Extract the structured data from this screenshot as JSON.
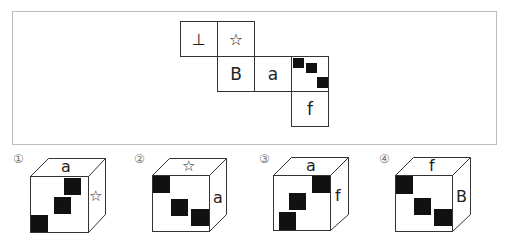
{
  "net": {
    "cells": [
      {
        "id": "t1",
        "label": "⊥",
        "symbol": "perpendicular"
      },
      {
        "id": "t2",
        "label": "☆",
        "symbol": "star"
      },
      {
        "id": "m1",
        "label": "B"
      },
      {
        "id": "m2",
        "label": "a"
      },
      {
        "id": "m3",
        "label": "",
        "symbol": "three-black-squares-diagonal"
      },
      {
        "id": "b1",
        "label": "f"
      }
    ]
  },
  "options": [
    {
      "number": "①",
      "top": "a",
      "right": "☆",
      "front": "three black squares (bottom-left to top-right)"
    },
    {
      "number": "②",
      "top": "☆",
      "right": "a",
      "front": "three black squares (top-left to bottom-right)"
    },
    {
      "number": "③",
      "top": "a",
      "right": "f",
      "front": "three black squares (bottom-left to top-right)"
    },
    {
      "number": "④",
      "top": "f",
      "right": "B",
      "front": "three black squares (top-left to bottom-right)"
    }
  ]
}
